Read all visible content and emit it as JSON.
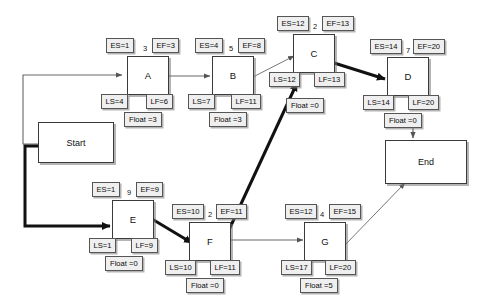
{
  "diagram": {
    "type": "activity-on-node",
    "critical_path_color": "#111111",
    "normal_edge_color": "#777777",
    "node_fill": "#ffffff",
    "chip_fill": "#efefef"
  },
  "terminals": [
    {
      "id": "start",
      "label": "Start"
    },
    {
      "id": "end",
      "label": "End"
    }
  ],
  "labels": {
    "es_prefix": "ES=",
    "ef_prefix": "EF=",
    "ls_prefix": "LS=",
    "lf_prefix": "LF=",
    "float_prefix": "Float ="
  },
  "nodes": [
    {
      "id": "A",
      "label": "A",
      "duration": "3",
      "es": "ES=1",
      "ef": "EF=3",
      "ls": "LS=4",
      "lf": "LF=6",
      "float": "Float =3",
      "critical": false
    },
    {
      "id": "B",
      "label": "B",
      "duration": "5",
      "es": "ES=4",
      "ef": "EF=8",
      "ls": "LS=7",
      "lf": "LF=11",
      "float": "Float =3",
      "critical": false
    },
    {
      "id": "C",
      "label": "C",
      "duration": "2",
      "es": "ES=12",
      "ef": "EF=13",
      "ls": "LS=12",
      "lf": "LF=13",
      "float": "Float =0",
      "critical": true
    },
    {
      "id": "D",
      "label": "D",
      "duration": "7",
      "es": "ES=14",
      "ef": "EF=20",
      "ls": "LS=14",
      "lf": "LF=20",
      "float": "Float =0",
      "critical": true
    },
    {
      "id": "E",
      "label": "E",
      "duration": "9",
      "es": "ES=1",
      "ef": "EF=9",
      "ls": "LS=1",
      "lf": "LF=9",
      "float": "Float =0",
      "critical": true
    },
    {
      "id": "F",
      "label": "F",
      "duration": "2",
      "es": "ES=10",
      "ef": "EF=11",
      "ls": "LS=10",
      "lf": "LF=11",
      "float": "Float =0",
      "critical": true
    },
    {
      "id": "G",
      "label": "G",
      "duration": "4",
      "es": "ES=12",
      "ef": "EF=15",
      "ls": "LS=17",
      "lf": "LF=20",
      "float": "Float =5",
      "critical": false
    }
  ],
  "edges": [
    {
      "from": "start",
      "to": "A",
      "critical": false
    },
    {
      "from": "start",
      "to": "E",
      "critical": true
    },
    {
      "from": "A",
      "to": "B",
      "critical": false
    },
    {
      "from": "B",
      "to": "C",
      "critical": false
    },
    {
      "from": "E",
      "to": "F",
      "critical": true
    },
    {
      "from": "F",
      "to": "C",
      "critical": true
    },
    {
      "from": "F",
      "to": "G",
      "critical": false
    },
    {
      "from": "C",
      "to": "D",
      "critical": true
    },
    {
      "from": "D",
      "to": "end",
      "critical": true
    },
    {
      "from": "G",
      "to": "end",
      "critical": false
    }
  ]
}
